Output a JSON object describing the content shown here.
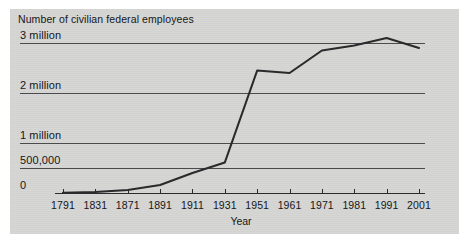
{
  "figure": {
    "background_color": "#ffffff",
    "panel_color": "#d6d6d4",
    "ink_color": "#2a2a2c"
  },
  "chart_data": {
    "type": "line",
    "title": "Number of civilian federal employees",
    "subtitle": "",
    "xlabel": "Year",
    "ylabel": "",
    "categories": [
      "1791",
      "1831",
      "1871",
      "1891",
      "1911",
      "1931",
      "1951",
      "1961",
      "1971",
      "1981",
      "1991",
      "2001"
    ],
    "x": [
      1791,
      1831,
      1871,
      1891,
      1911,
      1931,
      1951,
      1961,
      1971,
      1981,
      1991,
      2001
    ],
    "values": [
      5000,
      20000,
      60000,
      160000,
      400000,
      610000,
      2450000,
      2400000,
      2850000,
      2950000,
      3100000,
      2900000
    ],
    "value_labels": [
      "5,000",
      "20,000",
      "60,000",
      "160,000",
      "400,000",
      "610,000",
      "2.45 million",
      "2.4 million",
      "2.85 million",
      "2.95 million",
      "3.1 million",
      "2.9 million"
    ],
    "ytick_values": [
      0,
      500000,
      1000000,
      2000000,
      3000000
    ],
    "ytick_labels": [
      "0",
      "500,000",
      "1 million",
      "2 million",
      "3 million"
    ],
    "ylim": [
      0,
      3200000
    ],
    "xlim_index": [
      0,
      11
    ],
    "grid": true,
    "grid_axis": "y",
    "legend": false,
    "legend_position": "none",
    "series": [
      {
        "name": "Civilian federal employees",
        "color": "#2a2a2c",
        "values": [
          5000,
          20000,
          60000,
          160000,
          400000,
          610000,
          2450000,
          2400000,
          2850000,
          2950000,
          3100000,
          2900000
        ]
      }
    ],
    "annotations": []
  }
}
